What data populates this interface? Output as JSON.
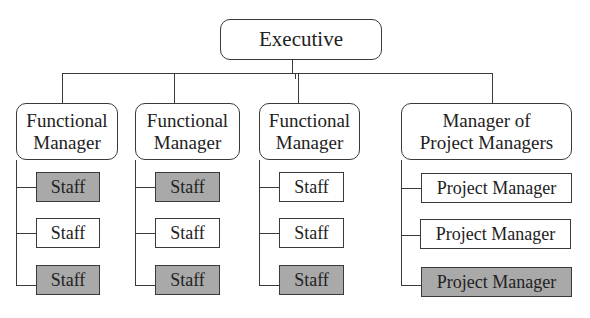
{
  "executive": {
    "label": "Executive"
  },
  "colors": {
    "line": "#3a3a3a",
    "shaded_fill": "#a9a9a9",
    "plain_fill": "#ffffff"
  },
  "columns": [
    {
      "manager": "Functional\nManager",
      "subordinates": [
        {
          "label": "Staff",
          "shaded": true
        },
        {
          "label": "Staff",
          "shaded": false
        },
        {
          "label": "Staff",
          "shaded": true
        }
      ]
    },
    {
      "manager": "Functional\nManager",
      "subordinates": [
        {
          "label": "Staff",
          "shaded": true
        },
        {
          "label": "Staff",
          "shaded": false
        },
        {
          "label": "Staff",
          "shaded": true
        }
      ]
    },
    {
      "manager": "Functional\nManager",
      "subordinates": [
        {
          "label": "Staff",
          "shaded": false
        },
        {
          "label": "Staff",
          "shaded": false
        },
        {
          "label": "Staff",
          "shaded": true
        }
      ]
    },
    {
      "manager": "Manager of\nProject Managers",
      "subordinates": [
        {
          "label": "Project Manager",
          "shaded": false
        },
        {
          "label": "Project Manager",
          "shaded": false
        },
        {
          "label": "Project Manager",
          "shaded": true
        }
      ]
    }
  ]
}
